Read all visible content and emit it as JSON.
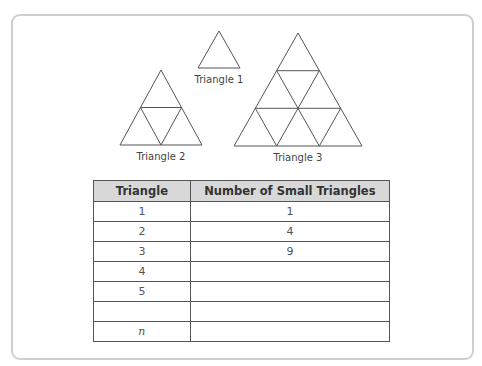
{
  "figures": {
    "triangle1": {
      "label": "Triangle 1",
      "small_triangles": 1
    },
    "triangle2": {
      "label": "Triangle 2",
      "small_triangles": 4
    },
    "triangle3": {
      "label": "Triangle 3",
      "small_triangles": 9
    },
    "line_color": "#555555"
  },
  "table": {
    "headers": [
      "Triangle",
      "Number of Small Triangles"
    ],
    "header_bg": "#d8d8d8",
    "rows": [
      {
        "triangle": "1",
        "count": "1"
      },
      {
        "triangle": "2",
        "count": "4"
      },
      {
        "triangle": "3",
        "count": "9"
      },
      {
        "triangle": "4",
        "count": ""
      },
      {
        "triangle": "5",
        "count": ""
      },
      {
        "triangle": "",
        "count": ""
      },
      {
        "triangle": "n",
        "count": ""
      }
    ]
  }
}
